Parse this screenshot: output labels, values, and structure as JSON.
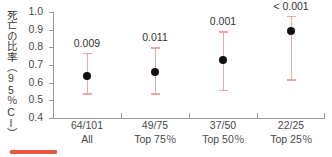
{
  "chart_data": {
    "type": "scatter",
    "title": "",
    "xlabel": "",
    "ylabel": "死亡の比率（95％CI）",
    "ylim": [
      0.4,
      1.0
    ],
    "yticks": [
      "1.0",
      "0.9",
      "0.8",
      "0.7",
      "0.6",
      "0.5",
      "0.4"
    ],
    "ytick_values": [
      1.0,
      0.9,
      0.8,
      0.7,
      0.6,
      0.5,
      0.4
    ],
    "grid": false,
    "legend": "none",
    "axis_baseline": 0.47,
    "categories": [
      "All",
      "Top 75％",
      "Top 50％",
      "Top 25％"
    ],
    "counts": [
      "64/101",
      "49/75",
      "37/50",
      "22/25"
    ],
    "values": [
      0.64,
      0.66,
      0.73,
      0.89
    ],
    "ci_low": [
      0.54,
      0.54,
      0.56,
      0.62
    ],
    "ci_high": [
      0.77,
      0.8,
      0.89,
      0.98
    ],
    "annotations": [
      "0.009",
      "0.011",
      "0.001",
      "< 0.001"
    ],
    "colors": {
      "marker": "#111111",
      "errorbar": "#eaa7a7",
      "axis": "#9a9a9a",
      "text": "#4a4a4a",
      "legend_swatch": "#e8573f"
    }
  },
  "legend_swatch": {
    "color": "#e8573f"
  }
}
